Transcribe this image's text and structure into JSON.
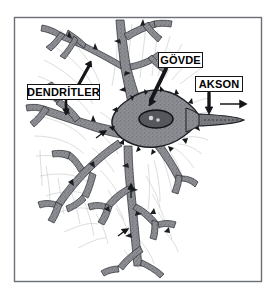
{
  "figure": {
    "language": "Turkish",
    "background_color": "#ffffff",
    "frame": {
      "color": "#6c6f76",
      "x": 14,
      "y": 17,
      "width": 248,
      "height": 265
    }
  },
  "labels": [
    {
      "id": "dendrites",
      "text": "DENDRİTLER",
      "box": {
        "x": 27,
        "y": 84,
        "width": 73,
        "height": 16
      },
      "pointer": "arrow-up-right-to-dendrite-branch"
    },
    {
      "id": "soma",
      "text": "GÖVDE",
      "box": {
        "x": 158,
        "y": 52,
        "width": 45,
        "height": 16
      },
      "pointer": "arrow-down-left-to-cell-body"
    },
    {
      "id": "axon",
      "text": "AKSON",
      "box": {
        "x": 195,
        "y": 76,
        "width": 48,
        "height": 16
      },
      "pointer": "arrow-down-to-axon"
    }
  ],
  "colors": {
    "ink": "#15161a",
    "frame": "#6c6f76",
    "soma_fill": "#8d8f94",
    "dendrite_fill": "#84868c",
    "nucleus_fill": "#4a4c52",
    "wisp": "#b9bbc0",
    "background": "#ffffff"
  },
  "parts": {
    "soma_label": "cell body (soma)",
    "nucleus_label": "nucleus",
    "nucleolus_label": "nucleolus",
    "axon_label": "axon",
    "dendrite_label": "dendrites",
    "signal_arrow_label": "signal direction arrow"
  }
}
